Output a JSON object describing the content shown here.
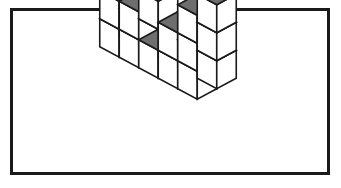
{
  "figure": {
    "frame": {
      "border_color": "#1a1a1a",
      "background_color": "#ffffff",
      "border_width_px": 3,
      "x": 10,
      "y": 8,
      "width": 320,
      "height": 167
    },
    "colors": {
      "top_face": "#6e6e6e",
      "left_face": "#ffffff",
      "right_face": "#ffffff",
      "outline": "#1a1a1a",
      "page_background": "#ffffff"
    },
    "projection": {
      "type": "isometric",
      "cube_half_width_px": 19.5,
      "cube_half_depth_px": 10.5,
      "cube_height_px": 28,
      "origin_x_px": 168,
      "origin_y_px": 52
    },
    "grid": {
      "columns": 5,
      "rows": 2,
      "heights_front_row": [
        3,
        2,
        1,
        2,
        3
      ],
      "heights_back_row": [
        3,
        2,
        1,
        2,
        3
      ],
      "total_cubes": 22
    },
    "stack_columns": [
      {
        "col": 0,
        "row": 0,
        "height": 3
      },
      {
        "col": 1,
        "row": 0,
        "height": 2
      },
      {
        "col": 2,
        "row": 0,
        "height": 1
      },
      {
        "col": 3,
        "row": 0,
        "height": 2
      },
      {
        "col": 4,
        "row": 0,
        "height": 3
      },
      {
        "col": 0,
        "row": 1,
        "height": 3
      },
      {
        "col": 1,
        "row": 1,
        "height": 2
      },
      {
        "col": 2,
        "row": 1,
        "height": 1
      },
      {
        "col": 3,
        "row": 1,
        "height": 2
      },
      {
        "col": 4,
        "row": 1,
        "height": 3
      }
    ]
  }
}
